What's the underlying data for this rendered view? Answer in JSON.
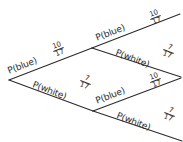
{
  "figure": {
    "kind": "probability-tree-diagram",
    "background_color": "#ffffff",
    "ink_color": "#2b2b2b"
  },
  "diagram_data": {
    "type": "tree",
    "stages": 2,
    "outcomes": [
      "blue",
      "white"
    ],
    "nodes": [
      {
        "id": "root",
        "x": 9,
        "y": 80
      },
      {
        "id": "n-blue",
        "x": 92,
        "y": 48
      },
      {
        "id": "n-white",
        "x": 93,
        "y": 111
      }
    ],
    "branches": [
      {
        "id": "b1",
        "from": "root",
        "to": "n-blue",
        "label": "P(blue)",
        "numerator": "10",
        "denominator": "17",
        "angle": -21
      },
      {
        "id": "b2",
        "from": "root",
        "to": "n-white",
        "label": "P(white)",
        "numerator": "7",
        "denominator": "17",
        "angle": 21
      },
      {
        "id": "b3",
        "from": "n-blue",
        "to": "end-1",
        "label": "P(blue)",
        "numerator": "10",
        "denominator": "17",
        "angle": -21
      },
      {
        "id": "b4",
        "from": "n-blue",
        "to": "end-2",
        "label": "P(white)",
        "numerator": "7",
        "denominator": "17",
        "angle": 21
      },
      {
        "id": "b5",
        "from": "n-white",
        "to": "end-3",
        "label": "P(blue)",
        "numerator": "10",
        "denominator": "17",
        "angle": -21
      },
      {
        "id": "b6",
        "from": "n-white",
        "to": "end-4",
        "label": "P(white)",
        "numerator": "7",
        "denominator": "17",
        "angle": 21
      }
    ]
  }
}
